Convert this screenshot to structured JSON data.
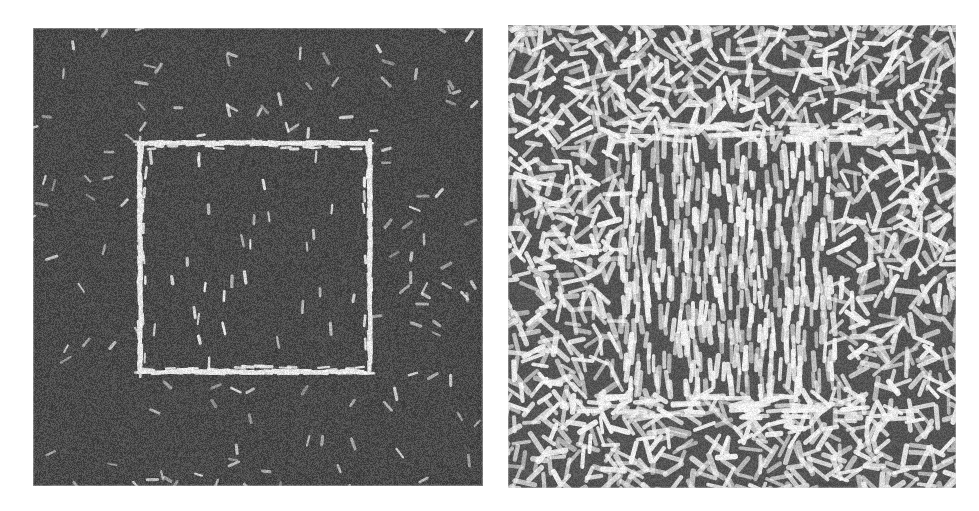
{
  "figure": {
    "caption": "",
    "background_color": "#ffffff",
    "width": 979,
    "height": 511,
    "type": "texture-segregation-stimulus-pair"
  },
  "panels": [
    {
      "id": "left-panel",
      "name": "low-density-texture-stimulus",
      "label": "",
      "x": 33,
      "y": 28,
      "width": 450,
      "height": 458,
      "background_color": "#4a4a4a",
      "element_color": "#e8e8e8",
      "noise_color": "#3a3a3a",
      "density": 0.035,
      "element_length": 9,
      "element_width": 2.6,
      "background_orientation": "random",
      "target": {
        "name": "embedded-square-region",
        "x": 107,
        "y": 115,
        "width": 230,
        "height": 229,
        "orientation": "vertical",
        "edge_outline": true,
        "edge_brightness": 0.95,
        "interior_density": 0.03
      }
    },
    {
      "id": "right-panel",
      "name": "high-density-texture-stimulus",
      "label": "",
      "x": 508,
      "y": 25,
      "width": 448,
      "height": 463,
      "background_color": "#555555",
      "element_color": "#f2f2f2",
      "noise_color": "#454545",
      "density": 0.62,
      "element_length": 17,
      "element_width": 4.4,
      "background_orientation": "random",
      "target": {
        "name": "embedded-square-region",
        "x": 112,
        "y": 120,
        "width": 215,
        "height": 248,
        "orientation": "vertical",
        "edge_outline": false,
        "edge_brightness": 1.0,
        "interior_density": 0.5
      }
    }
  ],
  "chart_data": {
    "type": "heatmap",
    "title": "",
    "xlabel": "",
    "ylabel": "",
    "series": [
      {
        "name": "left-field-sparse",
        "element_density": 0.035,
        "surround_orientation_deg": "random 0-180",
        "target_orientation_deg": 90,
        "target_bounds_px": [
          107,
          115,
          230,
          229
        ]
      },
      {
        "name": "right-field-dense",
        "element_density": 0.62,
        "surround_orientation_deg": "random 0-180",
        "target_orientation_deg": 90,
        "target_bounds_px": [
          112,
          120,
          215,
          248
        ]
      }
    ]
  }
}
